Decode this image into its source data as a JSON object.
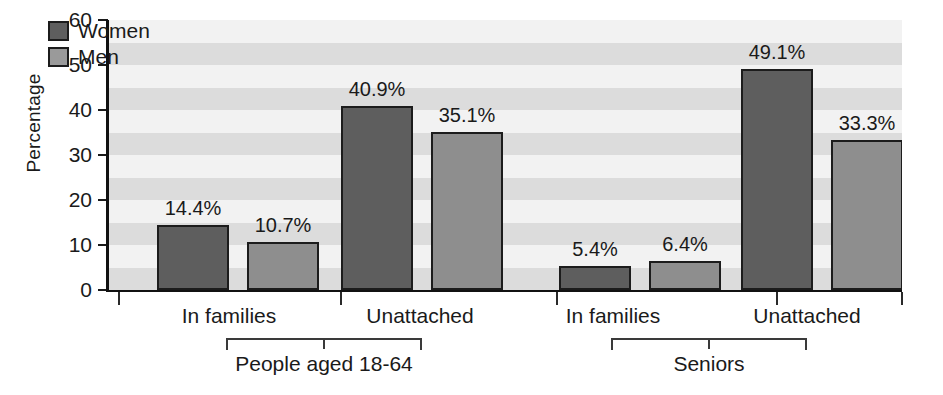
{
  "chart_data": {
    "type": "bar",
    "title": "",
    "xlabel": "",
    "ylabel": "Percentage",
    "ylim": [
      0,
      60
    ],
    "ytick_labels": [
      "0",
      "10",
      "20",
      "30",
      "40",
      "50",
      "60"
    ],
    "ytick_values": [
      0,
      10,
      20,
      30,
      40,
      50,
      60
    ],
    "grid": "horizontal alternating shaded bands",
    "legend_position": "top-left inside plot",
    "categories": [
      "In families",
      "Unattached",
      "In families",
      "Unattached"
    ],
    "series": [
      {
        "name": "Women",
        "color": "#5e5e5e",
        "values": [
          14.4,
          40.9,
          5.4,
          49.1
        ]
      },
      {
        "name": "Men",
        "color": "#8e8e8e",
        "values": [
          10.7,
          35.1,
          6.4,
          33.3
        ]
      }
    ],
    "data_labels": [
      "14.4%",
      "10.7%",
      "40.9%",
      "35.1%",
      "5.4%",
      "6.4%",
      "49.1%",
      "33.3%"
    ],
    "groups": [
      {
        "label": "People aged 18-64",
        "categories": [
          "In families",
          "Unattached"
        ]
      },
      {
        "label": "Seniors",
        "categories": [
          "In families",
          "Unattached"
        ]
      }
    ]
  },
  "legend": {
    "items": [
      {
        "label": "Women",
        "swatch": "#5e5e5e"
      },
      {
        "label": "Men",
        "swatch": "#9a9a9a"
      }
    ]
  },
  "axes": {
    "y_title": "Percentage",
    "y_ticks": [
      "60",
      "50",
      "40",
      "30",
      "20",
      "10",
      "0"
    ],
    "x_categories": [
      "In families",
      "Unattached",
      "In families",
      "Unattached"
    ]
  },
  "groups": {
    "left_label": "People aged 18-64",
    "right_label": "Seniors"
  },
  "bars": [
    {
      "label": "14.4%",
      "series": "Women",
      "value": 14.4
    },
    {
      "label": "10.7%",
      "series": "Men",
      "value": 10.7
    },
    {
      "label": "40.9%",
      "series": "Women",
      "value": 40.9
    },
    {
      "label": "35.1%",
      "series": "Men",
      "value": 35.1
    },
    {
      "label": "5.4%",
      "series": "Women",
      "value": 5.4
    },
    {
      "label": "6.4%",
      "series": "Men",
      "value": 6.4
    },
    {
      "label": "49.1%",
      "series": "Women",
      "value": 49.1
    },
    {
      "label": "33.3%",
      "series": "Men",
      "value": 33.3
    }
  ]
}
